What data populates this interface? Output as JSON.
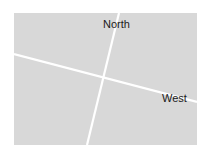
{
  "map": {
    "background_color": "#d8d8d8",
    "road_color": "#ffffff",
    "labels": {
      "north": "North",
      "west": "West"
    },
    "roads": [
      {
        "name": "north-south-road",
        "from": [
          105,
          0
        ],
        "to": [
          73,
          132
        ]
      },
      {
        "name": "east-west-road",
        "from": [
          0,
          41
        ],
        "to": [
          183,
          89
        ]
      }
    ]
  }
}
